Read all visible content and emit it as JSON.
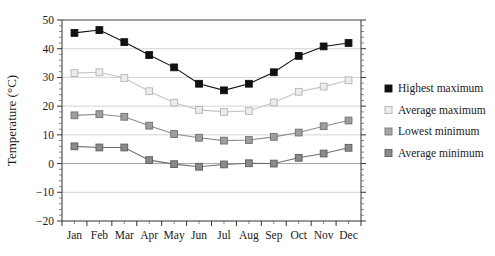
{
  "chart_data": {
    "type": "line",
    "title": "",
    "subtitle": "",
    "xlabel": "",
    "ylabel": "Temperature (°C)",
    "categories": [
      "Jan",
      "Feb",
      "Mar",
      "Apr",
      "May",
      "Jun",
      "Jul",
      "Aug",
      "Sep",
      "Oct",
      "Nov",
      "Dec"
    ],
    "ylim": [
      -20,
      50
    ],
    "ytick_labels": [
      "50",
      "40",
      "30",
      "20",
      "10",
      "0",
      "-10",
      "-20"
    ],
    "yticks": [
      50,
      40,
      30,
      20,
      10,
      0,
      -10,
      -20
    ],
    "grid": true,
    "grid_axis": "y",
    "legend_position": "right",
    "series": [
      {
        "name": "Highest maximum",
        "color": "#111111",
        "marker": "filled-square",
        "values": [
          45.5,
          46.5,
          42.3,
          37.8,
          33.5,
          27.8,
          25.5,
          27.8,
          31.8,
          37.5,
          40.8,
          42.0
        ]
      },
      {
        "name": "Average maximum",
        "color": "#d0d0d0",
        "marker": "open-square",
        "values": [
          31.5,
          31.8,
          29.8,
          25.2,
          21.2,
          18.7,
          18.0,
          18.3,
          21.3,
          25.0,
          26.8,
          29.0
        ]
      },
      {
        "name": "Lowest minimum",
        "color": "#8c8c8c",
        "marker": "shaded-square",
        "values": [
          16.8,
          17.2,
          16.3,
          13.2,
          10.3,
          9.0,
          8.0,
          8.2,
          9.3,
          10.8,
          13.0,
          15.0
        ]
      },
      {
        "name": "Average minimum",
        "color": "#707070",
        "marker": "shaded-square",
        "values": [
          6.0,
          5.6,
          5.6,
          1.2,
          -0.2,
          -1.1,
          -0.3,
          0.1,
          0.0,
          2.0,
          3.5,
          5.5
        ]
      }
    ]
  },
  "legend": {
    "items": [
      {
        "label": "Highest maximum",
        "color": "#111111"
      },
      {
        "label": "Average maximum",
        "color": "#d8d8d8"
      },
      {
        "label": "Lowest minimum",
        "color": "#a0a0a0"
      },
      {
        "label": "Average minimum",
        "color": "#787878"
      }
    ]
  }
}
